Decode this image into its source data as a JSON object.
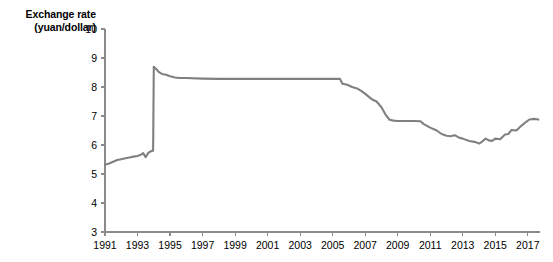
{
  "chart_data": {
    "type": "line",
    "title": "Exchange rate\n(yuan/dollar)",
    "title_line1": "Exchange rate",
    "title_line2": "(yuan/dollar)",
    "xlabel": "",
    "ylabel": "Exchange rate (yuan/dollar)",
    "ylim": [
      3,
      10
    ],
    "xlim": [
      1991,
      2017.75
    ],
    "yticks": [
      3,
      4,
      5,
      6,
      7,
      8,
      9,
      10
    ],
    "ytick_labels": [
      "3",
      "4",
      "5",
      "6",
      "7",
      "8",
      "9",
      "10"
    ],
    "xticks": [
      1991,
      1993,
      1995,
      1997,
      1999,
      2001,
      2003,
      2005,
      2007,
      2009,
      2011,
      2013,
      2015,
      2017
    ],
    "xtick_labels": [
      "1991",
      "1993",
      "1995",
      "1997",
      "1999",
      "2001",
      "2003",
      "2005",
      "2007",
      "2009",
      "2011",
      "2013",
      "2015",
      "2017"
    ],
    "grid": false,
    "legend": "none",
    "line_color": "#808080",
    "axis_color": "#8a8a8a",
    "text_color": "#000000",
    "background": "#ffffff",
    "series": [
      {
        "name": "Exchange rate (yuan/dollar)",
        "color": "#808080",
        "x": [
          1991.0,
          1991.25,
          1991.5,
          1991.75,
          1992.0,
          1992.25,
          1992.5,
          1992.75,
          1993.0,
          1993.2,
          1993.35,
          1993.5,
          1993.65,
          1993.8,
          1993.96,
          1994.0,
          1994.15,
          1994.3,
          1994.5,
          1994.75,
          1995.0,
          1995.3,
          1995.6,
          1996.0,
          1997.0,
          1998.0,
          1999.0,
          2000.0,
          2001.0,
          2002.0,
          2003.0,
          2004.0,
          2005.0,
          2005.45,
          2005.6,
          2005.9,
          2006.2,
          2006.5,
          2006.8,
          2007.1,
          2007.4,
          2007.7,
          2008.0,
          2008.25,
          2008.5,
          2008.75,
          2009.0,
          2009.5,
          2010.0,
          2010.4,
          2010.6,
          2011.0,
          2011.4,
          2011.7,
          2012.0,
          2012.25,
          2012.5,
          2012.75,
          2013.0,
          2013.4,
          2013.8,
          2014.0,
          2014.2,
          2014.4,
          2014.6,
          2014.8,
          2015.0,
          2015.3,
          2015.6,
          2015.8,
          2016.0,
          2016.3,
          2016.6,
          2016.9,
          2017.1,
          2017.4,
          2017.65
        ],
        "y": [
          5.32,
          5.36,
          5.42,
          5.48,
          5.51,
          5.54,
          5.57,
          5.6,
          5.62,
          5.66,
          5.72,
          5.58,
          5.72,
          5.78,
          5.8,
          8.7,
          8.62,
          8.52,
          8.45,
          8.42,
          8.37,
          8.33,
          8.31,
          8.31,
          8.29,
          8.28,
          8.28,
          8.28,
          8.28,
          8.28,
          8.28,
          8.28,
          8.28,
          8.28,
          8.11,
          8.08,
          8.0,
          7.95,
          7.85,
          7.72,
          7.58,
          7.5,
          7.3,
          7.05,
          6.87,
          6.84,
          6.83,
          6.83,
          6.83,
          6.82,
          6.72,
          6.6,
          6.5,
          6.38,
          6.32,
          6.3,
          6.34,
          6.26,
          6.22,
          6.14,
          6.1,
          6.05,
          6.12,
          6.22,
          6.16,
          6.14,
          6.22,
          6.2,
          6.36,
          6.38,
          6.52,
          6.5,
          6.66,
          6.8,
          6.88,
          6.9,
          6.88
        ]
      }
    ],
    "annotations": []
  },
  "geometry": {
    "plot_left": 105,
    "plot_right": 540,
    "plot_top": 29,
    "plot_bottom": 232
  }
}
